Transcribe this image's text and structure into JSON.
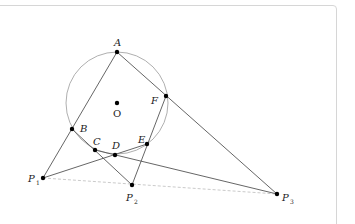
{
  "diagram": {
    "type": "geometry-figure",
    "colors": {
      "line": "#555555",
      "circle": "#9a9a9a",
      "dashed": "#bdbdbd",
      "point": "#000000",
      "card_border": "#d6d6d6"
    },
    "circle": {
      "center": "O",
      "cx": 117,
      "cy": 103,
      "r": 51
    },
    "points": [
      {
        "id": "A",
        "label": "A",
        "x": 117,
        "y": 52
      },
      {
        "id": "B",
        "label": "B",
        "x": 72,
        "y": 129
      },
      {
        "id": "C",
        "label": "C",
        "x": 95,
        "y": 150
      },
      {
        "id": "D",
        "label": "D",
        "x": 115,
        "y": 155
      },
      {
        "id": "E",
        "label": "E",
        "x": 147,
        "y": 144
      },
      {
        "id": "F",
        "label": "F",
        "x": 166,
        "y": 96
      },
      {
        "id": "O",
        "label": "O",
        "x": 117,
        "y": 103
      },
      {
        "id": "P1",
        "label": "P",
        "sub": "1",
        "x": 43,
        "y": 178
      },
      {
        "id": "P2",
        "label": "P",
        "sub": "2",
        "x": 132,
        "y": 185
      },
      {
        "id": "P3",
        "label": "P",
        "sub": "3",
        "x": 277,
        "y": 194
      }
    ],
    "segments": [
      {
        "from": "A",
        "to": "P1",
        "style": "solid"
      },
      {
        "from": "A",
        "to": "P3",
        "style": "solid"
      },
      {
        "from": "B",
        "to": "P2",
        "style": "solid"
      },
      {
        "from": "F",
        "to": "P2",
        "style": "solid"
      },
      {
        "from": "P1",
        "to": "E",
        "style": "solid"
      },
      {
        "from": "C",
        "to": "P3",
        "style": "solid"
      },
      {
        "from": "P1",
        "to": "P3",
        "style": "dashed"
      }
    ]
  }
}
